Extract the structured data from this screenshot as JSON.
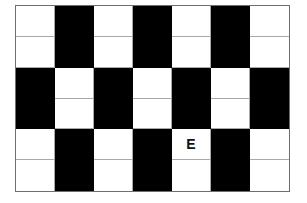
{
  "figure": {
    "title": "",
    "type": "checkerboard-grid",
    "columns": 7,
    "rows": 6,
    "colors": {
      "light_cell": "#ffffff",
      "dark_cell": "#000000",
      "gridline": "#a9a9ac",
      "outer_border": "#6e6e70",
      "background": "#ffffff",
      "label_text": "#111111"
    }
  },
  "grid": {
    "cells": [
      [
        {
          "fill": "light",
          "label": ""
        },
        {
          "fill": "dark",
          "label": ""
        },
        {
          "fill": "light",
          "label": ""
        },
        {
          "fill": "dark",
          "label": ""
        },
        {
          "fill": "light",
          "label": ""
        },
        {
          "fill": "dark",
          "label": ""
        },
        {
          "fill": "light",
          "label": ""
        }
      ],
      [
        {
          "fill": "light",
          "label": ""
        },
        {
          "fill": "dark",
          "label": ""
        },
        {
          "fill": "light",
          "label": ""
        },
        {
          "fill": "dark",
          "label": ""
        },
        {
          "fill": "light",
          "label": ""
        },
        {
          "fill": "dark",
          "label": ""
        },
        {
          "fill": "light",
          "label": ""
        }
      ],
      [
        {
          "fill": "dark",
          "label": ""
        },
        {
          "fill": "light",
          "label": ""
        },
        {
          "fill": "dark",
          "label": ""
        },
        {
          "fill": "light",
          "label": ""
        },
        {
          "fill": "dark",
          "label": ""
        },
        {
          "fill": "light",
          "label": ""
        },
        {
          "fill": "dark",
          "label": ""
        }
      ],
      [
        {
          "fill": "dark",
          "label": ""
        },
        {
          "fill": "light",
          "label": ""
        },
        {
          "fill": "dark",
          "label": ""
        },
        {
          "fill": "light",
          "label": ""
        },
        {
          "fill": "dark",
          "label": ""
        },
        {
          "fill": "light",
          "label": ""
        },
        {
          "fill": "dark",
          "label": ""
        }
      ],
      [
        {
          "fill": "light",
          "label": ""
        },
        {
          "fill": "dark",
          "label": ""
        },
        {
          "fill": "light",
          "label": ""
        },
        {
          "fill": "dark",
          "label": ""
        },
        {
          "fill": "light",
          "label": "E"
        },
        {
          "fill": "dark",
          "label": ""
        },
        {
          "fill": "light",
          "label": ""
        }
      ],
      [
        {
          "fill": "light",
          "label": ""
        },
        {
          "fill": "dark",
          "label": ""
        },
        {
          "fill": "light",
          "label": ""
        },
        {
          "fill": "dark",
          "label": ""
        },
        {
          "fill": "light",
          "label": ""
        },
        {
          "fill": "dark",
          "label": ""
        },
        {
          "fill": "light",
          "label": ""
        }
      ]
    ]
  },
  "labels": {
    "marked_cell_text": "E",
    "marked_cell_row": 5,
    "marked_cell_column": 5
  }
}
